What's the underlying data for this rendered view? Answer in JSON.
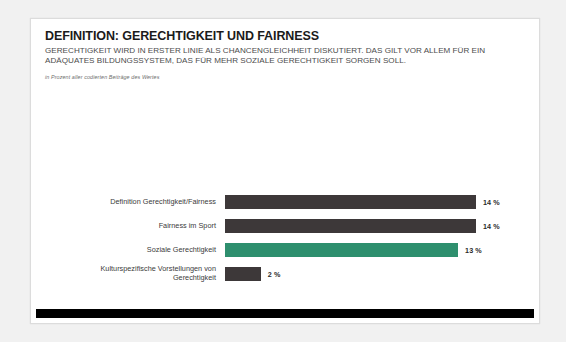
{
  "card": {
    "header": {
      "title": "DEFINITION: GERECHTIGKEIT UND FAIRNESS",
      "subtitle": "GERECHTIGKEIT WIRD IN ERSTER LINIE ALS CHANCENGLEICHHEIT DISKUTIERT. DAS GILT VOR ALLEM FÜR EIN ADÄQUATES BILDUNGSSYSTEM, DAS FÜR MEHR SOZIALE GERECHTIGKEIT SORGEN SOLL.",
      "source_note": "in Prozent aller codierten Beiträge des Wertes"
    }
  },
  "colors": {
    "bar_default": "#3d3839",
    "bar_accent": "#2e8f6e",
    "footer": "#000000",
    "page_background": "#f1f1f1",
    "card_background": "#ffffff"
  },
  "chart_data": {
    "type": "bar",
    "orientation": "horizontal",
    "title": "DEFINITION: GERECHTIGKEIT UND FAIRNESS",
    "subtitle": "GERECHTIGKEIT WIRD IN ERSTER LINIE ALS CHANCENGLEICHHEIT DISKUTIERT. DAS GILT VOR ALLEM FÜR EIN ADÄQUATES BILDUNGSSYSTEM, DAS FÜR MEHR SOZIALE GERECHTIGKEIT SORGEN SOLL.",
    "xlabel": "",
    "ylabel": "",
    "unit": "%",
    "xlim": [
      0,
      14
    ],
    "grid": false,
    "legend": false,
    "categories": [
      "Definition Gerechtigkeit/Fairness",
      "Fairness im Sport",
      "Soziale Gerechtigkeit",
      "Kulturspezifische Vorstellungen von\nGerechtigkeit"
    ],
    "values": [
      14,
      14,
      13,
      2
    ],
    "value_labels": [
      "14 %",
      "14 %",
      "13 %",
      "2 %"
    ],
    "highlight_index": 2
  }
}
